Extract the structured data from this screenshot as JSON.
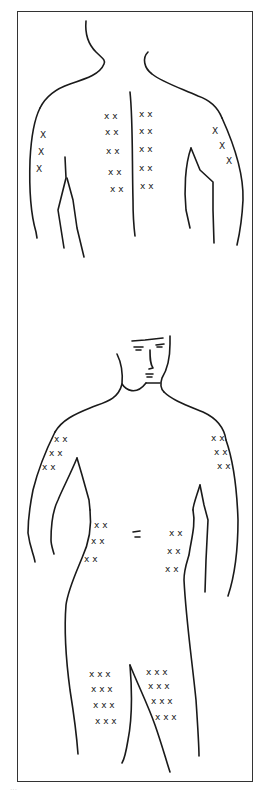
{
  "diagram": {
    "views": [
      {
        "name": "back-view",
        "sites": [
          {
            "region": "left-upper-arm",
            "rows": [
              "X",
              "X",
              "X"
            ]
          },
          {
            "region": "upper-back-left-of-spine",
            "rows": [
              "x x",
              "x x",
              "x x",
              "x x",
              "x x"
            ]
          },
          {
            "region": "upper-back-right-of-spine",
            "rows": [
              "x x",
              "x x",
              "x x",
              "x x",
              "x x"
            ]
          },
          {
            "region": "right-upper-arm",
            "rows": [
              "X",
              "X",
              "X"
            ]
          }
        ]
      },
      {
        "name": "front-view",
        "sites": [
          {
            "region": "right-upper-arm",
            "rows": [
              "x x",
              "x x",
              "x x"
            ]
          },
          {
            "region": "left-upper-arm",
            "rows": [
              "x x",
              "x x",
              "x x"
            ]
          },
          {
            "region": "right-abdomen",
            "rows": [
              "x x",
              "x x",
              "x x"
            ]
          },
          {
            "region": "navel",
            "rows": [
              "="
            ]
          },
          {
            "region": "left-abdomen",
            "rows": [
              "x x",
              "x x",
              "x x"
            ]
          },
          {
            "region": "right-thigh",
            "rows": [
              "x x x",
              "x x x",
              "x x x",
              "x x x"
            ]
          },
          {
            "region": "left-thigh",
            "rows": [
              "x x x",
              "x x x",
              "x x x",
              "x x x"
            ]
          }
        ]
      }
    ],
    "mark_glyph": "x",
    "line_color": "#1a1a1a",
    "frame_color": "#333333"
  },
  "caption": "···"
}
